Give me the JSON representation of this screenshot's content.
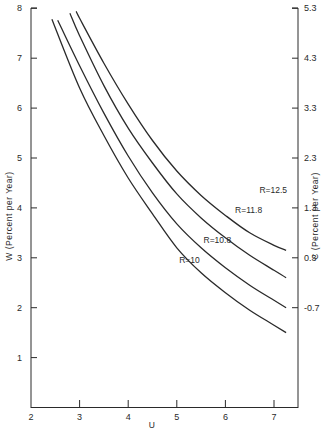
{
  "chart_data": {
    "type": "line",
    "title": "",
    "xlabel": "U",
    "ylabel": "W (Percent per Year)",
    "y2label": "C (Percent per Year)",
    "xlim": [
      2,
      7.5
    ],
    "ylim": [
      0,
      8
    ],
    "y2lim": [
      -2.7,
      5.3
    ],
    "grid": false,
    "legend": "inline curve labels",
    "x_ticks": [
      2,
      3,
      4,
      5,
      6,
      7
    ],
    "y_ticks": [
      1,
      2,
      3,
      4,
      5,
      6,
      7,
      8
    ],
    "y2_ticks": [
      5.3,
      4.3,
      3.3,
      2.3,
      1.3,
      0.3,
      -0.7
    ],
    "x_tick_labels": [
      "2",
      "3",
      "4",
      "5",
      "6",
      "7"
    ],
    "y_tick_labels": [
      "1",
      "2",
      "3",
      "4",
      "5",
      "6",
      "7",
      "8"
    ],
    "y2_tick_labels": [
      "5.3",
      "4.3",
      "3.3",
      "2.3",
      "1.3",
      "0.3",
      "-0.7"
    ],
    "series": [
      {
        "name": "R=10",
        "label": "R=10",
        "x": [
          2.43,
          3.0,
          3.5,
          4.0,
          4.5,
          5.0,
          5.5,
          6.0,
          6.5,
          7.0,
          7.25
        ],
        "y": [
          7.78,
          6.4,
          5.45,
          4.6,
          3.88,
          3.2,
          2.7,
          2.3,
          1.95,
          1.65,
          1.5
        ]
      },
      {
        "name": "R=10.8",
        "label": "R=10.8",
        "x": [
          2.55,
          3.0,
          3.5,
          4.0,
          4.5,
          5.0,
          5.5,
          6.0,
          6.5,
          7.0,
          7.25
        ],
        "y": [
          7.76,
          6.85,
          5.9,
          5.04,
          4.3,
          3.68,
          3.2,
          2.8,
          2.45,
          2.15,
          2.0
        ]
      },
      {
        "name": "R=11.8",
        "label": "R=11.8",
        "x": [
          2.8,
          3.0,
          3.5,
          4.0,
          4.5,
          5.0,
          5.5,
          6.0,
          6.5,
          7.0,
          7.25
        ],
        "y": [
          7.9,
          7.45,
          6.45,
          5.6,
          4.9,
          4.28,
          3.8,
          3.4,
          3.05,
          2.75,
          2.6
        ]
      },
      {
        "name": "R=12.5",
        "label": "R=12.5",
        "x": [
          2.93,
          3.0,
          3.5,
          4.0,
          4.5,
          5.0,
          5.5,
          6.0,
          6.5,
          7.0,
          7.25
        ],
        "y": [
          7.94,
          7.8,
          6.9,
          6.08,
          5.35,
          4.74,
          4.25,
          3.85,
          3.5,
          3.25,
          3.15
        ]
      }
    ],
    "annotations": [
      {
        "text": "R=10",
        "x": 5.05,
        "y": 2.9
      },
      {
        "text": "R=10.8",
        "x": 5.55,
        "y": 3.3
      },
      {
        "text": "R=11.8",
        "x": 6.2,
        "y": 3.9
      },
      {
        "text": "R=12.5",
        "x": 6.7,
        "y": 4.3
      }
    ]
  },
  "colors": {
    "background": "#ffffff",
    "ink": "#2a2a2a"
  }
}
